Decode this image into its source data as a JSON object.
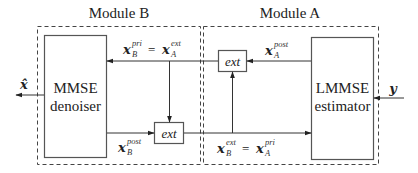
{
  "modules": {
    "module_b": {
      "title": "Module B"
    },
    "module_a": {
      "title": "Module A"
    }
  },
  "blocks": {
    "mmse": {
      "line1": "MMSE",
      "line2": "denoiser"
    },
    "lmmse": {
      "line1": "LMMSE",
      "line2": "estimator"
    },
    "ext_top": {
      "label": "ext"
    },
    "ext_bottom": {
      "label": "ext"
    }
  },
  "signals": {
    "x_hat": {
      "base": "x̂"
    },
    "y": {
      "base": "y"
    },
    "x_A_post": {
      "base": "x",
      "sup": "post",
      "sub": "A"
    },
    "x_B_pri_eq": {
      "lhs_base": "x",
      "lhs_sup": "pri",
      "lhs_sub": "B",
      "op": "=",
      "rhs_base": "x",
      "rhs_sup": "ext",
      "rhs_sub": "A"
    },
    "x_B_post": {
      "base": "x",
      "sup": "post",
      "sub": "B"
    },
    "x_B_ext_eq": {
      "lhs_base": "x",
      "lhs_sup": "ext",
      "lhs_sub": "B",
      "op": "=",
      "rhs_base": "x",
      "rhs_sup": "pri",
      "rhs_sub": "A"
    }
  },
  "colors": {
    "line": "#333333",
    "box_border": "#555555",
    "dashed": "#444444",
    "background": "#ffffff"
  }
}
